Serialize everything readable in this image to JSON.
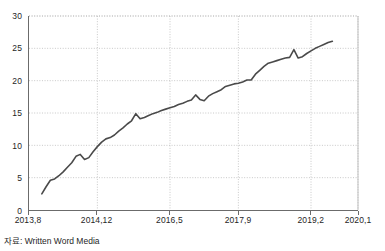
{
  "chart_data": {
    "type": "line",
    "title": "",
    "subtitle": "",
    "xlabel": "",
    "ylabel": "",
    "source_note": "자료: Written Word Media",
    "grid": true,
    "legend": null,
    "legend_position": "none",
    "line_color": "#4a4a4a",
    "grid_color": "#b9b9b9",
    "axis_color": "#6b6b6b",
    "ylim": [
      0,
      30
    ],
    "ytick_values": [
      0,
      5,
      10,
      15,
      20,
      25,
      30
    ],
    "ytick_labels": [
      "0",
      "5",
      "10",
      "15",
      "20",
      "25",
      "30"
    ],
    "xtick_labels": [
      "2013,8",
      "2014,12",
      "2016,5",
      "2017,9",
      "2019,2",
      "2020,1"
    ],
    "xtick_positions": [
      0,
      16,
      33,
      49,
      66,
      77
    ],
    "xlim": [
      0,
      77
    ],
    "x_unit": "month index from 2013,8",
    "series": [
      {
        "name": "series-1",
        "x": [
          3,
          4,
          5,
          6,
          7,
          8,
          9,
          10,
          11,
          12,
          13,
          14,
          15,
          16,
          17,
          18,
          19,
          20,
          21,
          22,
          23,
          24,
          25,
          26,
          27,
          28,
          29,
          30,
          31,
          32,
          33,
          34,
          35,
          36,
          37,
          38,
          39,
          40,
          41,
          42,
          43,
          44,
          45,
          46,
          47,
          48,
          49,
          50,
          51,
          52,
          53,
          54,
          55,
          56,
          57,
          58,
          59,
          60,
          61,
          62,
          63,
          64,
          65,
          66,
          67,
          68,
          69,
          70,
          71
        ],
        "values": [
          2.5,
          3.6,
          4.6,
          4.8,
          5.3,
          5.9,
          6.6,
          7.3,
          8.3,
          8.6,
          7.8,
          8.1,
          9.0,
          9.8,
          10.5,
          11.0,
          11.2,
          11.6,
          12.2,
          12.7,
          13.3,
          13.8,
          14.9,
          14.1,
          14.3,
          14.6,
          14.9,
          15.1,
          15.4,
          15.6,
          15.8,
          16.0,
          16.3,
          16.5,
          16.8,
          17.0,
          17.8,
          17.1,
          16.9,
          17.6,
          18.0,
          18.3,
          18.6,
          19.1,
          19.3,
          19.5,
          19.6,
          19.8,
          20.1,
          20.1,
          21.0,
          21.6,
          22.2,
          22.7,
          22.9,
          23.1,
          23.3,
          23.5,
          23.6,
          24.8,
          23.5,
          23.7,
          24.2,
          24.6,
          25.0,
          25.3,
          25.6,
          25.9,
          26.1
        ]
      }
    ]
  }
}
